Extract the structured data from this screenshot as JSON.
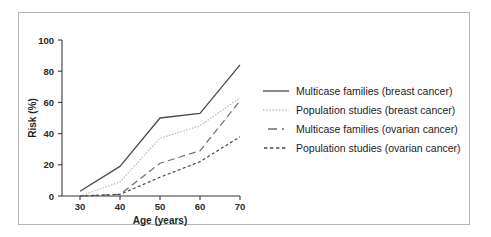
{
  "chart_data": {
    "type": "line",
    "title": "",
    "xlabel": "Age (years)",
    "ylabel": "Risk (%)",
    "xlim": [
      30,
      70
    ],
    "ylim": [
      0,
      100
    ],
    "xticks": [
      30,
      40,
      50,
      60,
      70
    ],
    "yticks": [
      0,
      20,
      40,
      60,
      80,
      100
    ],
    "grid": false,
    "legend_position": "right",
    "x": [
      30,
      40,
      50,
      60,
      70
    ],
    "series": [
      {
        "name": "Multicase families (breast cancer)",
        "style": "solid",
        "color": "#4a4a4a",
        "values": [
          3,
          19,
          50,
          53,
          84
        ]
      },
      {
        "name": "Population studies (breast cancer)",
        "style": "dotted",
        "color": "#b8b8b8",
        "values": [
          0,
          9,
          37,
          45,
          63
        ]
      },
      {
        "name": "Multicase families (ovarian cancer)",
        "style": "long-dash",
        "color": "#6e6e6e",
        "values": [
          0,
          1,
          21,
          29,
          61
        ]
      },
      {
        "name": "Population studies (ovarian cancer)",
        "style": "short-dash",
        "color": "#4a4a4a",
        "values": [
          0,
          1,
          12,
          22,
          38
        ]
      }
    ]
  },
  "legend": {
    "items": [
      {
        "label": "Multicase families (breast cancer)",
        "style": "solid"
      },
      {
        "label": "Population studies (breast cancer)",
        "style": "dotted"
      },
      {
        "label": "Multicase families (ovarian cancer)",
        "style": "long-dash"
      },
      {
        "label": "Population studies (ovarian cancer)",
        "style": "short-dash"
      }
    ]
  }
}
